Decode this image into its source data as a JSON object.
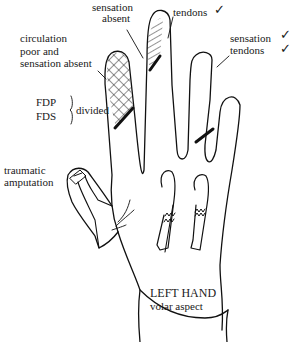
{
  "diagram": {
    "title": "LEFT HAND",
    "subtitle": "volar aspect",
    "annotations": {
      "index": {
        "text_line1": "circulation",
        "text_line2": "poor and",
        "text_line3": "sensation absent"
      },
      "middle": {
        "text_line1": "sensation",
        "text_line2": "absent"
      },
      "middle_tendons": {
        "text": "tendons",
        "check": "✓"
      },
      "ring": {
        "line1": "sensation",
        "line2": "tendons",
        "check1": "✓",
        "check2": "✓"
      },
      "tendons_divided": {
        "fdp": "FDP",
        "fds": "FDS",
        "text": "divided"
      },
      "thumb": {
        "line1": "traumatic",
        "line2": "amputation"
      }
    },
    "legend": {
      "crosshatch": "circulation poor and sensation absent",
      "diagonal_hatch": "sensation absent"
    }
  }
}
